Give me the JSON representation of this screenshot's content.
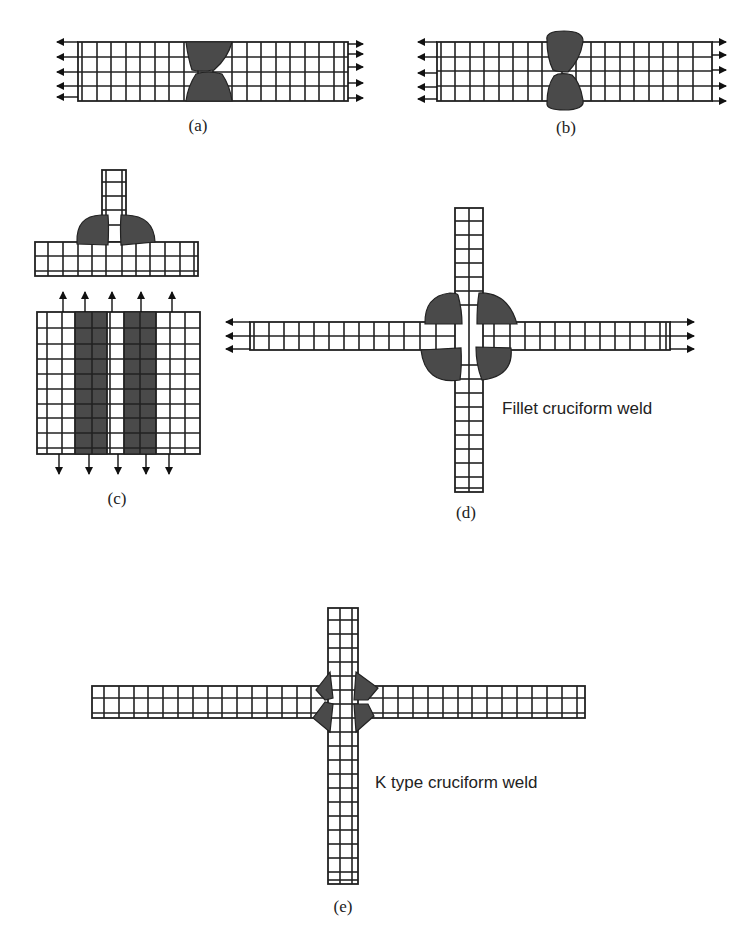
{
  "figure": {
    "panels": [
      {
        "id": "a",
        "caption": "(a)",
        "description": "Butt weld, double-V, tensile load along plate"
      },
      {
        "id": "b",
        "caption": "(b)",
        "description": "Butt weld with reinforcement, tensile load along plate"
      },
      {
        "id": "c",
        "caption": "(c)",
        "description": "T-joint fillet weld, side view and plan view with transverse load"
      },
      {
        "id": "d",
        "caption": "(d)",
        "label": "Fillet cruciform weld"
      },
      {
        "id": "e",
        "caption": "(e)",
        "label": "K type cruciform weld"
      }
    ],
    "colors": {
      "background": "#ffffff",
      "line": "#222222",
      "weld_fill": "#4a4a4a"
    }
  }
}
